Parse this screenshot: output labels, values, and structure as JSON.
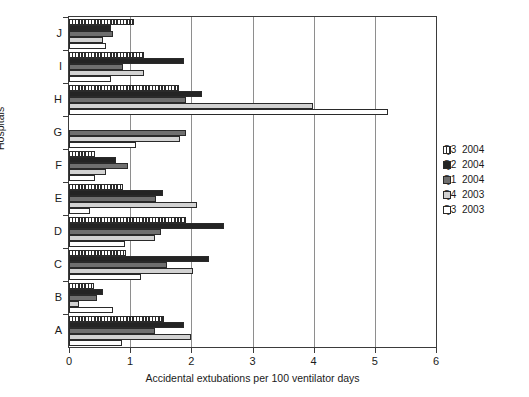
{
  "chart_data": {
    "type": "bar",
    "orientation": "horizontal",
    "title": "",
    "xlabel": "Accidental extubations per 100 ventilator days",
    "ylabel": "Hospitals",
    "xlim": [
      0,
      6
    ],
    "xticks": [
      0,
      1,
      2,
      3,
      4,
      5,
      6
    ],
    "xtick_labels": [
      "0",
      "1",
      "2",
      "3",
      "4",
      "5",
      "6"
    ],
    "grid": "vertical",
    "legend_position": "right",
    "categories": [
      "A",
      "B",
      "C",
      "D",
      "E",
      "F",
      "G",
      "H",
      "I",
      "J"
    ],
    "series": [
      {
        "name": "Q3  2004",
        "quarter": "Q3",
        "year": "2004",
        "fill": "hatched",
        "color": "#2b2b2b",
        "values": [
          1.56,
          0.41,
          0.93,
          1.91,
          0.88,
          0.42,
          0.0,
          1.8,
          1.23,
          1.06
        ]
      },
      {
        "name": "Q2  2004",
        "quarter": "Q2",
        "year": "2004",
        "fill": "solid",
        "color": "#242424",
        "values": [
          1.88,
          0.55,
          2.29,
          2.53,
          1.53,
          0.77,
          0.0,
          2.18,
          1.88,
          0.69
        ]
      },
      {
        "name": "Q1  2004",
        "quarter": "Q1",
        "year": "2004",
        "fill": "solid",
        "color": "#6f6f6f",
        "values": [
          1.4,
          0.46,
          1.6,
          1.5,
          1.42,
          0.96,
          1.92,
          1.91,
          0.88,
          0.72
        ]
      },
      {
        "name": "Q4  2003",
        "quarter": "Q4",
        "year": "2003",
        "fill": "solid",
        "color": "#d2d2d2",
        "values": [
          1.99,
          0.17,
          2.02,
          1.41,
          2.1,
          0.61,
          1.81,
          3.99,
          1.23,
          0.55
        ]
      },
      {
        "name": "Q3  2003",
        "quarter": "Q3",
        "year": "2003",
        "fill": "solid",
        "color": "#ffffff",
        "values": [
          0.86,
          0.72,
          1.17,
          0.91,
          0.34,
          0.43,
          1.09,
          5.21,
          0.68,
          0.6
        ]
      }
    ]
  },
  "legend": {
    "entries": [
      {
        "quarter": "Q3",
        "year": "2004"
      },
      {
        "quarter": "Q2",
        "year": "2004"
      },
      {
        "quarter": "Q1",
        "year": "2004"
      },
      {
        "quarter": "Q4",
        "year": "2003"
      },
      {
        "quarter": "Q3",
        "year": "2003"
      }
    ]
  }
}
